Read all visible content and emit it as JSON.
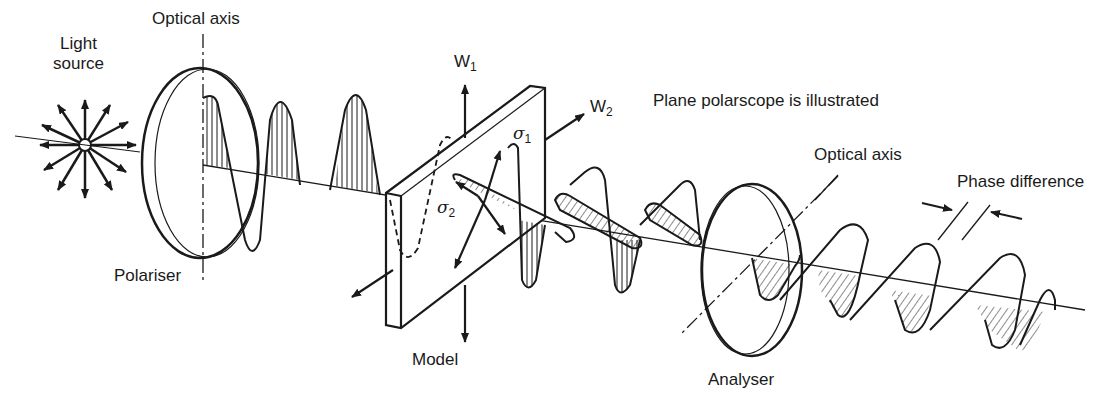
{
  "title": "Plane polarscope is illustrated",
  "colors": {
    "ink": "#1a1a1a",
    "background": "#ffffff"
  },
  "labels": {
    "light_source_line1": "Light",
    "light_source_line2": "source",
    "optical_axis_1": "Optical axis",
    "polariser": "Polariser",
    "w1": "W",
    "w1_sub": "1",
    "w2": "W",
    "w2_sub": "2",
    "sigma1": "σ",
    "sigma1_sub": "1",
    "sigma2": "σ",
    "sigma2_sub": "2",
    "model": "Model",
    "optical_axis_2": "Optical axis",
    "phase_difference": "Phase difference",
    "analyser": "Analyser"
  }
}
